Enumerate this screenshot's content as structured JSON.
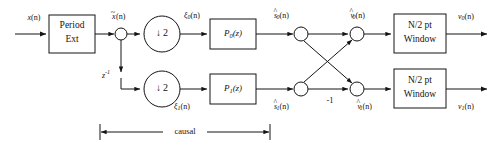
{
  "diagram": {
    "type": "signal-flow-block-diagram",
    "line_color": "#141414",
    "background_color": "#ffffff",
    "inputs": [
      {
        "label": "x(n)",
        "base": "x",
        "arg": "(n)"
      }
    ],
    "outputs": [
      {
        "label": "v0(n)",
        "base": "v",
        "sub": "0",
        "arg": "(n)"
      },
      {
        "label": "v1(n)",
        "base": "v",
        "sub": "1",
        "arg": "(n)"
      }
    ],
    "blocks": [
      {
        "id": "period-ext",
        "line1": "Period",
        "line2": "Ext"
      },
      {
        "id": "decimator-top",
        "label": "2",
        "arrow": "↓"
      },
      {
        "id": "decimator-bottom",
        "label": "2",
        "arrow": "↓"
      },
      {
        "id": "polyphase-p0",
        "base": "P",
        "sub": "0",
        "arg": "(z)"
      },
      {
        "id": "polyphase-p1",
        "base": "P",
        "sub": "1",
        "arg": "(z)"
      },
      {
        "id": "window-top",
        "line1": "N/2 pt",
        "line2": "Window"
      },
      {
        "id": "window-bottom",
        "line1": "N/2 pt",
        "line2": "Window"
      }
    ],
    "delay": {
      "label": "z",
      "exponent": "-1"
    },
    "gain": {
      "label": "-1"
    },
    "signals": {
      "x_tilde": {
        "base": "x",
        "accent": "~",
        "arg": "(n)"
      },
      "xi_0": {
        "base": "ξ",
        "sub": "0",
        "arg": "(n)"
      },
      "xi_1": {
        "base": "ξ",
        "sub": "1",
        "arg": "(n)"
      },
      "s_hat_0": {
        "base": "s",
        "accent": "^",
        "sub": "0",
        "arg": "(n)"
      },
      "s_hat_1": {
        "base": "s",
        "accent": "^",
        "sub": "1",
        "arg": "(n)"
      },
      "v_hat_0": {
        "base": "v",
        "accent": "^",
        "sub": "0",
        "arg": "(n)"
      },
      "v_hat_1": {
        "base": "v",
        "accent": "^",
        "sub": "1",
        "arg": "(n)"
      }
    },
    "annotation": {
      "span_label": "causal"
    }
  }
}
